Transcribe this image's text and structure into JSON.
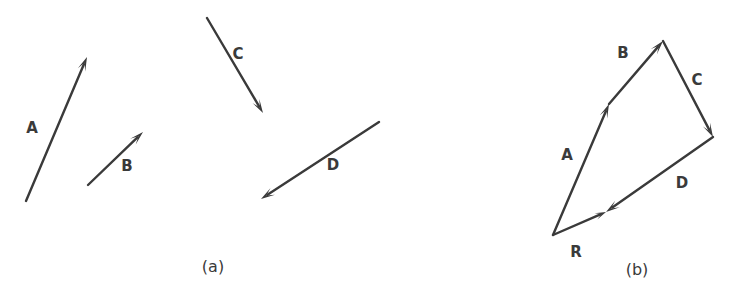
{
  "figure": {
    "background_color": "#ffffff",
    "stroke_color": "#3a3a3a",
    "panels": [
      {
        "id": "a",
        "caption": "(a)",
        "caption_pos": {
          "x": 213,
          "y": 267
        },
        "description": "Four separate vectors drawn in arbitrary positions",
        "vectors": [
          {
            "name": "A",
            "label": "A",
            "label_pos": {
              "x": 32,
              "y": 128
            },
            "tail": {
              "x": 26,
              "y": 201
            },
            "tip": {
              "x": 87,
              "y": 57
            }
          },
          {
            "name": "B",
            "label": "B",
            "label_pos": {
              "x": 127,
              "y": 166
            },
            "tail": {
              "x": 88,
              "y": 185
            },
            "tip": {
              "x": 143,
              "y": 132
            }
          },
          {
            "name": "C",
            "label": "C",
            "label_pos": {
              "x": 238,
              "y": 54
            },
            "tail": {
              "x": 207,
              "y": 18
            },
            "tip": {
              "x": 263,
              "y": 113
            }
          },
          {
            "name": "D",
            "label": "D",
            "label_pos": {
              "x": 333,
              "y": 165
            },
            "tail": {
              "x": 379,
              "y": 122
            },
            "tip": {
              "x": 261,
              "y": 199
            }
          }
        ]
      },
      {
        "id": "b",
        "caption": "(b)",
        "caption_pos": {
          "x": 637,
          "y": 270
        },
        "description": "Same vectors joined tip-to-tail with resultant R closing the polygon",
        "vectors": [
          {
            "name": "A",
            "label": "A",
            "label_pos": {
              "x": 567,
              "y": 155
            },
            "tail": {
              "x": 553,
              "y": 235
            },
            "tip": {
              "x": 609,
              "y": 104
            }
          },
          {
            "name": "B",
            "label": "B",
            "label_pos": {
              "x": 623,
              "y": 53
            },
            "tail": {
              "x": 609,
              "y": 104
            },
            "tip": {
              "x": 663,
              "y": 41
            }
          },
          {
            "name": "C",
            "label": "C",
            "label_pos": {
              "x": 697,
              "y": 80
            },
            "tail": {
              "x": 663,
              "y": 41
            },
            "tip": {
              "x": 713,
              "y": 137
            }
          },
          {
            "name": "D",
            "label": "D",
            "label_pos": {
              "x": 682,
              "y": 183
            },
            "tail": {
              "x": 713,
              "y": 137
            },
            "tip": {
              "x": 606,
              "y": 212
            }
          },
          {
            "name": "R",
            "label": "R",
            "label_pos": {
              "x": 576,
              "y": 252
            },
            "tail": {
              "x": 553,
              "y": 235
            },
            "tip": {
              "x": 606,
              "y": 212
            }
          }
        ]
      }
    ]
  }
}
